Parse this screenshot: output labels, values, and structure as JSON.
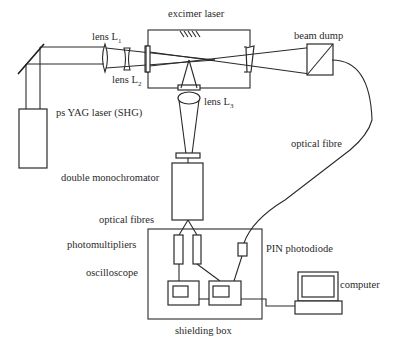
{
  "diagram": {
    "labels": {
      "excimer_laser": "excimer laser",
      "beam_dump": "beam dump",
      "lens_l1": "lens L",
      "lens_l1_sub": "1",
      "lens_l2": "lens L",
      "lens_l2_sub": "2",
      "lens_l3": "lens L",
      "lens_l3_sub": "3",
      "yag_laser": "ps YAG laser (SHG)",
      "optical_fibre": "optical fibre",
      "double_monochromator": "double monochromator",
      "optical_fibres": "optical fibres",
      "photomultipliers": "photomultipliers",
      "oscilloscope": "oscilloscope",
      "pin_photodiode": "PIN photodiode",
      "computer": "computer",
      "shielding_box": "shielding box"
    },
    "colors": {
      "line": "#2a2a2a",
      "background": "#ffffff"
    }
  }
}
